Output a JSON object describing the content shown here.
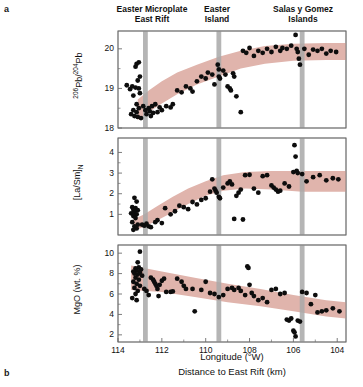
{
  "figure": {
    "panel_a_letter": "a",
    "panel_b_letter": "b",
    "panel_b_axis_title": "Distance to East Rift (km)"
  },
  "column_headers": [
    {
      "id": "easter-microplate-east-rift",
      "line1": "Easter Microplate",
      "line2": "East Rift",
      "longitude": 112.75
    },
    {
      "id": "easter-island",
      "line1": "Easter",
      "line2": "Island",
      "longitude": 109.4
    },
    {
      "id": "salas-y-gomez-islands",
      "line1": "Salas y Gomez",
      "line2": "Islands",
      "longitude": 105.6
    }
  ],
  "colors": {
    "band": "#e0b4ac",
    "marker": "#0d0d0d",
    "guide_bar": "#a8a8a8",
    "axis": "#6e6e6e",
    "text": "#111111"
  },
  "xaxis": {
    "label": "Longitude (°W)",
    "ticks": [
      114,
      112,
      110,
      108,
      106,
      104
    ],
    "tick_labels": [
      "114",
      "112",
      "110",
      "108",
      "106",
      "104"
    ],
    "min": 114.0,
    "max": 103.6,
    "minor_step": 1,
    "inverted": true
  },
  "chart_data": [
    {
      "type": "scatter",
      "id": "panel-206pb",
      "title": "",
      "xlabel": "Longitude (°W)",
      "ylabel": "206Pb/204Pb",
      "ylabel_parts": {
        "sup1": "206",
        "mid": "Pb/",
        "sup2": "204",
        "tail": "Pb"
      },
      "ylim": [
        18.0,
        20.45
      ],
      "yticks": [
        18,
        19,
        20
      ],
      "ytick_labels": [
        "18",
        "19",
        "20"
      ],
      "grid": false,
      "band": {
        "name": "trend-envelope",
        "color": "#e0b4ac",
        "upper": [
          [
            113.1,
            18.72
          ],
          [
            112.6,
            18.95
          ],
          [
            112.0,
            19.18
          ],
          [
            111.3,
            19.4
          ],
          [
            110.4,
            19.6
          ],
          [
            109.4,
            19.8
          ],
          [
            108.4,
            19.95
          ],
          [
            107.3,
            20.07
          ],
          [
            106.0,
            20.13
          ],
          [
            104.5,
            20.15
          ],
          [
            103.6,
            20.15
          ]
        ],
        "lower": [
          [
            113.1,
            18.2
          ],
          [
            112.6,
            18.4
          ],
          [
            112.0,
            18.62
          ],
          [
            111.3,
            18.85
          ],
          [
            110.4,
            19.1
          ],
          [
            109.4,
            19.3
          ],
          [
            108.4,
            19.5
          ],
          [
            107.3,
            19.62
          ],
          [
            106.0,
            19.7
          ],
          [
            104.5,
            19.72
          ],
          [
            103.6,
            19.72
          ]
        ]
      },
      "points": [
        [
          113.15,
          19.62
        ],
        [
          113.05,
          19.66
        ],
        [
          113.2,
          19.55
        ],
        [
          113.0,
          19.3
        ],
        [
          113.1,
          19.2
        ],
        [
          113.35,
          19.05
        ],
        [
          113.2,
          19.02
        ],
        [
          113.05,
          19.0
        ],
        [
          113.45,
          18.98
        ],
        [
          113.0,
          18.88
        ],
        [
          113.3,
          18.82
        ],
        [
          113.15,
          18.6
        ],
        [
          113.05,
          18.5
        ],
        [
          113.3,
          18.45
        ],
        [
          113.15,
          18.4
        ],
        [
          113.25,
          18.3
        ],
        [
          113.1,
          18.28
        ],
        [
          113.4,
          18.35
        ],
        [
          112.85,
          18.55
        ],
        [
          112.75,
          18.45
        ],
        [
          112.7,
          18.35
        ],
        [
          112.6,
          18.5
        ],
        [
          112.55,
          18.42
        ],
        [
          112.5,
          18.3
        ],
        [
          112.45,
          18.55
        ],
        [
          112.4,
          18.38
        ],
        [
          112.3,
          18.6
        ],
        [
          112.2,
          18.4
        ],
        [
          112.1,
          18.52
        ],
        [
          112.0,
          18.45
        ],
        [
          111.8,
          18.55
        ],
        [
          111.6,
          18.52
        ],
        [
          111.5,
          18.6
        ],
        [
          111.3,
          18.95
        ],
        [
          111.1,
          18.9
        ],
        [
          110.9,
          19.05
        ],
        [
          110.7,
          19.0
        ],
        [
          110.6,
          18.92
        ],
        [
          110.4,
          19.18
        ],
        [
          110.2,
          19.3
        ],
        [
          110.0,
          19.25
        ],
        [
          109.9,
          19.4
        ],
        [
          109.7,
          19.35
        ],
        [
          109.6,
          19.1
        ],
        [
          109.45,
          19.6
        ],
        [
          109.4,
          19.48
        ],
        [
          109.4,
          19.3
        ],
        [
          109.35,
          19.25
        ],
        [
          109.2,
          19.45
        ],
        [
          109.1,
          19.35
        ],
        [
          109.0,
          19.05
        ],
        [
          108.9,
          19.0
        ],
        [
          108.85,
          18.95
        ],
        [
          108.75,
          19.38
        ],
        [
          108.7,
          19.3
        ],
        [
          108.6,
          18.8
        ],
        [
          108.4,
          18.4
        ],
        [
          108.3,
          19.95
        ],
        [
          108.15,
          19.9
        ],
        [
          108.0,
          20.02
        ],
        [
          107.8,
          19.82
        ],
        [
          107.6,
          19.95
        ],
        [
          107.4,
          19.9
        ],
        [
          107.2,
          20.0
        ],
        [
          107.0,
          19.92
        ],
        [
          106.8,
          20.05
        ],
        [
          106.6,
          19.95
        ],
        [
          106.5,
          20.02
        ],
        [
          106.3,
          20.0
        ],
        [
          106.1,
          20.08
        ],
        [
          105.9,
          20.35
        ],
        [
          105.85,
          20.0
        ],
        [
          105.8,
          19.92
        ],
        [
          105.75,
          19.75
        ],
        [
          105.7,
          19.6
        ],
        [
          105.5,
          20.0
        ],
        [
          105.3,
          19.85
        ],
        [
          105.1,
          19.98
        ],
        [
          104.9,
          19.95
        ],
        [
          104.7,
          20.0
        ],
        [
          104.5,
          19.88
        ],
        [
          104.3,
          19.95
        ],
        [
          104.05,
          19.92
        ],
        [
          113.6,
          19.08
        ],
        [
          112.95,
          18.25
        ]
      ]
    },
    {
      "type": "scatter",
      "id": "panel-lasm",
      "title": "",
      "xlabel": "Longitude (°W)",
      "ylabel": "[La/Sm]N",
      "ylabel_parts": {
        "main": "[La/Sm]",
        "sub": "N"
      },
      "ylim": [
        0.0,
        4.7
      ],
      "yticks": [
        1,
        2,
        3,
        4
      ],
      "ytick_labels": [
        "1",
        "2",
        "3",
        "4"
      ],
      "grid": false,
      "band": {
        "name": "trend-envelope",
        "color": "#e0b4ac",
        "upper": [
          [
            113.3,
            0.75
          ],
          [
            112.8,
            1.0
          ],
          [
            112.2,
            1.4
          ],
          [
            111.5,
            1.85
          ],
          [
            110.8,
            2.25
          ],
          [
            110.0,
            2.6
          ],
          [
            109.2,
            2.9
          ],
          [
            108.2,
            3.05
          ],
          [
            107.0,
            3.1
          ],
          [
            105.6,
            3.1
          ],
          [
            104.0,
            3.1
          ],
          [
            103.6,
            3.1
          ]
        ],
        "lower": [
          [
            113.3,
            0.2
          ],
          [
            112.8,
            0.4
          ],
          [
            112.2,
            0.72
          ],
          [
            111.5,
            1.1
          ],
          [
            110.8,
            1.5
          ],
          [
            110.0,
            1.9
          ],
          [
            109.2,
            2.15
          ],
          [
            108.2,
            2.25
          ],
          [
            107.0,
            2.2
          ],
          [
            105.6,
            2.1
          ],
          [
            104.0,
            2.1
          ],
          [
            103.6,
            2.1
          ]
        ]
      },
      "points": [
        [
          113.25,
          1.8
        ],
        [
          113.15,
          1.62
        ],
        [
          113.35,
          1.35
        ],
        [
          113.2,
          1.3
        ],
        [
          113.3,
          1.22
        ],
        [
          113.1,
          1.2
        ],
        [
          113.25,
          1.12
        ],
        [
          113.4,
          1.05
        ],
        [
          113.15,
          1.0
        ],
        [
          113.3,
          0.92
        ],
        [
          113.2,
          0.82
        ],
        [
          113.35,
          0.62
        ],
        [
          113.1,
          0.5
        ],
        [
          113.25,
          0.42
        ],
        [
          113.15,
          0.32
        ],
        [
          113.3,
          0.25
        ],
        [
          112.9,
          0.5
        ],
        [
          112.8,
          0.45
        ],
        [
          112.7,
          0.55
        ],
        [
          112.6,
          0.42
        ],
        [
          112.5,
          0.38
        ],
        [
          112.3,
          0.62
        ],
        [
          112.2,
          0.72
        ],
        [
          112.0,
          0.58
        ],
        [
          111.85,
          1.3
        ],
        [
          111.6,
          1.0
        ],
        [
          111.4,
          1.15
        ],
        [
          111.2,
          1.42
        ],
        [
          111.0,
          1.35
        ],
        [
          110.8,
          1.25
        ],
        [
          110.6,
          1.6
        ],
        [
          110.4,
          1.48
        ],
        [
          110.2,
          1.7
        ],
        [
          110.0,
          1.78
        ],
        [
          109.8,
          2.1
        ],
        [
          109.7,
          2.7
        ],
        [
          109.6,
          2.25
        ],
        [
          109.55,
          2.15
        ],
        [
          109.5,
          2.05
        ],
        [
          109.4,
          1.85
        ],
        [
          109.35,
          1.78
        ],
        [
          109.2,
          2.3
        ],
        [
          109.0,
          2.5
        ],
        [
          108.9,
          2.6
        ],
        [
          108.8,
          2.45
        ],
        [
          108.7,
          0.78
        ],
        [
          108.6,
          1.9
        ],
        [
          108.5,
          2.05
        ],
        [
          108.4,
          2.2
        ],
        [
          108.3,
          0.75
        ],
        [
          108.2,
          2.9
        ],
        [
          108.0,
          2.92
        ],
        [
          107.8,
          2.25
        ],
        [
          107.6,
          2.05
        ],
        [
          107.4,
          2.85
        ],
        [
          107.2,
          2.9
        ],
        [
          107.0,
          2.4
        ],
        [
          106.9,
          2.3
        ],
        [
          106.8,
          2.2
        ],
        [
          106.7,
          2.1
        ],
        [
          106.6,
          2.15
        ],
        [
          106.4,
          2.5
        ],
        [
          106.2,
          2.35
        ],
        [
          106.0,
          3.05
        ],
        [
          105.95,
          4.35
        ],
        [
          105.9,
          3.8
        ],
        [
          105.85,
          3.1
        ],
        [
          105.8,
          3.0
        ],
        [
          105.6,
          2.95
        ],
        [
          105.4,
          2.6
        ],
        [
          105.1,
          2.8
        ],
        [
          104.8,
          2.9
        ],
        [
          104.5,
          2.65
        ],
        [
          104.2,
          2.75
        ],
        [
          103.95,
          2.7
        ]
      ]
    },
    {
      "type": "scatter",
      "id": "panel-mgo",
      "title": "",
      "xlabel": "Longitude (°W)",
      "ylabel": "MgO (wt. %)",
      "ylim": [
        1.3,
        10.8
      ],
      "yticks": [
        2,
        4,
        6,
        8,
        10
      ],
      "ytick_labels": [
        "2",
        "4",
        "6",
        "8",
        "10"
      ],
      "grid": false,
      "band": {
        "name": "trend-envelope",
        "color": "#e0b4ac",
        "upper": [
          [
            113.4,
            8.8
          ],
          [
            112.0,
            8.2
          ],
          [
            110.5,
            7.6
          ],
          [
            109.0,
            7.0
          ],
          [
            107.5,
            6.5
          ],
          [
            106.0,
            5.9
          ],
          [
            104.5,
            5.4
          ],
          [
            103.6,
            5.2
          ]
        ],
        "lower": [
          [
            113.4,
            6.4
          ],
          [
            112.0,
            6.2
          ],
          [
            110.5,
            5.7
          ],
          [
            109.0,
            5.2
          ],
          [
            107.5,
            4.8
          ],
          [
            106.0,
            4.3
          ],
          [
            104.5,
            3.8
          ],
          [
            103.6,
            3.6
          ]
        ]
      },
      "points": [
        [
          113.0,
          10.15
        ],
        [
          113.1,
          9.1
        ],
        [
          113.05,
          8.6
        ],
        [
          113.2,
          8.5
        ],
        [
          112.95,
          8.4
        ],
        [
          113.15,
          8.3
        ],
        [
          113.3,
          8.2
        ],
        [
          113.0,
          8.1
        ],
        [
          113.25,
          8.0
        ],
        [
          113.1,
          7.9
        ],
        [
          112.9,
          7.8
        ],
        [
          113.2,
          7.6
        ],
        [
          113.05,
          7.4
        ],
        [
          113.3,
          7.2
        ],
        [
          113.15,
          7.0
        ],
        [
          113.0,
          6.8
        ],
        [
          113.25,
          6.6
        ],
        [
          113.1,
          6.3
        ],
        [
          113.2,
          6.0
        ],
        [
          113.35,
          5.6
        ],
        [
          113.15,
          5.4
        ],
        [
          112.8,
          6.5
        ],
        [
          112.7,
          6.3
        ],
        [
          112.5,
          7.6
        ],
        [
          112.4,
          7.4
        ],
        [
          112.35,
          7.2
        ],
        [
          112.3,
          7.0
        ],
        [
          112.25,
          6.8
        ],
        [
          112.2,
          6.5
        ],
        [
          112.15,
          5.8
        ],
        [
          112.0,
          7.3
        ],
        [
          111.9,
          7.5
        ],
        [
          111.8,
          6.2
        ],
        [
          111.6,
          6.2
        ],
        [
          111.5,
          6.25
        ],
        [
          111.3,
          7.5
        ],
        [
          111.1,
          7.2
        ],
        [
          110.9,
          6.5
        ],
        [
          110.6,
          6.5
        ],
        [
          110.5,
          4.3
        ],
        [
          110.2,
          6.4
        ],
        [
          110.0,
          7.2
        ],
        [
          109.8,
          6.1
        ],
        [
          109.6,
          6.0
        ],
        [
          109.4,
          5.7
        ],
        [
          109.2,
          5.9
        ],
        [
          109.0,
          6.5
        ],
        [
          108.8,
          6.6
        ],
        [
          108.7,
          6.4
        ],
        [
          108.5,
          6.6
        ],
        [
          108.4,
          6.3
        ],
        [
          108.2,
          5.9
        ],
        [
          108.1,
          8.7
        ],
        [
          108.05,
          8.55
        ],
        [
          108.0,
          6.9
        ],
        [
          107.9,
          6.1
        ],
        [
          107.8,
          5.8
        ],
        [
          107.6,
          5.4
        ],
        [
          107.4,
          5.6
        ],
        [
          107.2,
          5.2
        ],
        [
          107.0,
          6.4
        ],
        [
          106.8,
          6.5
        ],
        [
          106.6,
          6.0
        ],
        [
          106.4,
          6.1
        ],
        [
          106.3,
          3.5
        ],
        [
          106.2,
          3.4
        ],
        [
          106.1,
          3.6
        ],
        [
          106.0,
          2.4
        ],
        [
          105.95,
          2.25
        ],
        [
          105.9,
          1.85
        ],
        [
          105.8,
          3.4
        ],
        [
          105.7,
          3.3
        ],
        [
          105.6,
          6.2
        ],
        [
          105.4,
          6.1
        ],
        [
          105.2,
          5.0
        ],
        [
          105.0,
          5.9
        ],
        [
          104.9,
          4.2
        ],
        [
          104.7,
          4.3
        ],
        [
          104.5,
          4.4
        ],
        [
          104.2,
          4.6
        ],
        [
          103.9,
          4.3
        ],
        [
          112.6,
          5.9
        ],
        [
          112.1,
          6.9
        ],
        [
          111.0,
          6.8
        ]
      ]
    }
  ]
}
